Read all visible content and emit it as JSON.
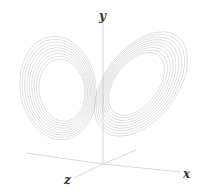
{
  "figure": {
    "axes": {
      "x_label": "x",
      "y_label": "y",
      "z_label": "z"
    },
    "colors": {
      "background": "#ffffff",
      "trajectory": "#8a8a8a",
      "axis": "#cfcfcf",
      "label": "#333333"
    },
    "lobes": [
      {
        "name": "left-lobe",
        "cx": 58,
        "cy": 88,
        "rx_outer": 38,
        "ry_outer": 52,
        "rotation": -8,
        "rings": 9
      },
      {
        "name": "right-lobe",
        "cx": 141,
        "cy": 84,
        "rx_outer": 36,
        "ry_outer": 60,
        "rotation": 38,
        "rings": 9
      }
    ]
  }
}
